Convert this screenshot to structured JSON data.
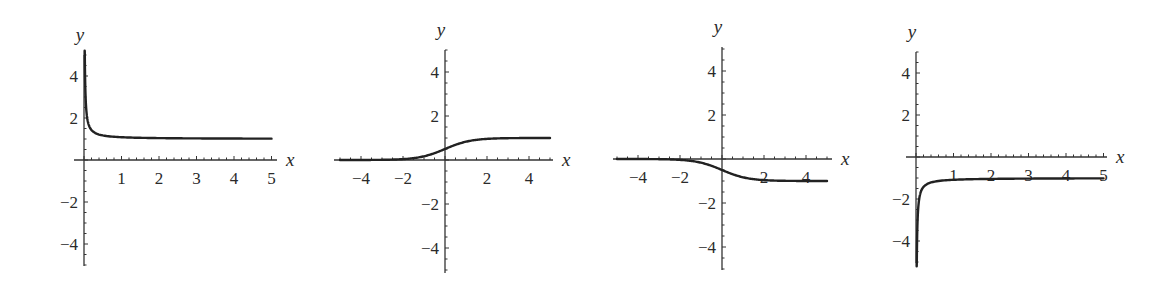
{
  "chart_data": [
    {
      "type": "line",
      "title": "",
      "xlabel": "x",
      "ylabel": "y",
      "xlim": [
        0,
        5
      ],
      "ylim": [
        -5,
        5
      ],
      "x_ticks": [
        1,
        2,
        3,
        4,
        5
      ],
      "y_ticks": [
        4,
        2,
        -2,
        -4
      ],
      "grid": false,
      "description": "Decreasing curve with vertical asymptote at x=0, approaching horizontal asymptote y=1",
      "series": [
        {
          "name": "curve",
          "x": [
            0.02,
            0.05,
            0.1,
            0.2,
            0.5,
            1,
            2,
            3,
            4,
            5
          ],
          "y": [
            5,
            2.6,
            1.8,
            1.4,
            1.16,
            1.08,
            1.04,
            1.03,
            1.02,
            1.02
          ]
        }
      ],
      "geometry": {
        "ox": 84,
        "oy": 160,
        "sx": 37.5,
        "sy": 21,
        "xaxis": [
          74,
          277
        ],
        "yaxis": [
          55,
          266
        ],
        "fn": "pos_hyp"
      }
    },
    {
      "type": "line",
      "title": "",
      "xlabel": "x",
      "ylabel": "y",
      "xlim": [
        -5,
        5
      ],
      "ylim": [
        -5,
        5
      ],
      "x_ticks": [
        -4,
        -2,
        2,
        4
      ],
      "y_ticks": [
        4,
        2,
        -2,
        -4
      ],
      "grid": false,
      "description": "Increasing sigmoid from 0 to 1, y(0)=0.5",
      "series": [
        {
          "name": "curve",
          "x": [
            -5,
            -4,
            -2,
            -1,
            0,
            1,
            2,
            4,
            5
          ],
          "y": [
            0.01,
            0.02,
            0.12,
            0.27,
            0.5,
            0.73,
            0.88,
            0.98,
            0.99
          ]
        }
      ],
      "geometry": {
        "ox": 445,
        "oy": 160,
        "sx": 21,
        "sy": 22,
        "xaxis": [
          334,
          553
        ],
        "yaxis": [
          50,
          273
        ],
        "fn": "sigmoid_up"
      }
    },
    {
      "type": "line",
      "title": "",
      "xlabel": "x",
      "ylabel": "y",
      "xlim": [
        -5,
        5
      ],
      "ylim": [
        -5,
        5
      ],
      "x_ticks": [
        -4,
        -2,
        2,
        4
      ],
      "y_ticks": [
        4,
        2,
        -2,
        -4
      ],
      "grid": false,
      "description": "Decreasing sigmoid from 0 to -1, y(0)=-0.5",
      "series": [
        {
          "name": "curve",
          "x": [
            -5,
            -4,
            -2,
            -1,
            0,
            1,
            2,
            4,
            5
          ],
          "y": [
            -0.01,
            -0.02,
            -0.12,
            -0.27,
            -0.5,
            -0.73,
            -0.88,
            -0.98,
            -0.99
          ]
        }
      ],
      "geometry": {
        "ox": 722,
        "oy": 159,
        "sx": 21,
        "sy": 22,
        "xaxis": [
          613,
          832
        ],
        "yaxis": [
          47,
          270
        ],
        "fn": "sigmoid_down"
      }
    },
    {
      "type": "line",
      "title": "",
      "xlabel": "x",
      "ylabel": "y",
      "xlim": [
        0,
        5
      ],
      "ylim": [
        -5,
        5
      ],
      "x_ticks": [
        1,
        2,
        3,
        4,
        5
      ],
      "y_ticks": [
        4,
        2,
        -2,
        -4
      ],
      "grid": false,
      "description": "Increasing curve with vertical asymptote at x=0 (toward -infinity), approaching horizontal asymptote y=-1",
      "series": [
        {
          "name": "curve",
          "x": [
            0.02,
            0.05,
            0.1,
            0.2,
            0.5,
            1,
            2,
            3,
            4,
            5
          ],
          "y": [
            -5,
            -2.6,
            -1.8,
            -1.4,
            -1.16,
            -1.08,
            -1.04,
            -1.03,
            -1.02,
            -1.02
          ]
        }
      ],
      "geometry": {
        "ox": 916,
        "oy": 157,
        "sx": 37.5,
        "sy": 21,
        "xaxis": [
          906,
          1107
        ],
        "yaxis": [
          52,
          263
        ],
        "fn": "neg_hyp"
      }
    }
  ],
  "labels": {
    "x": "x",
    "y": "y"
  }
}
